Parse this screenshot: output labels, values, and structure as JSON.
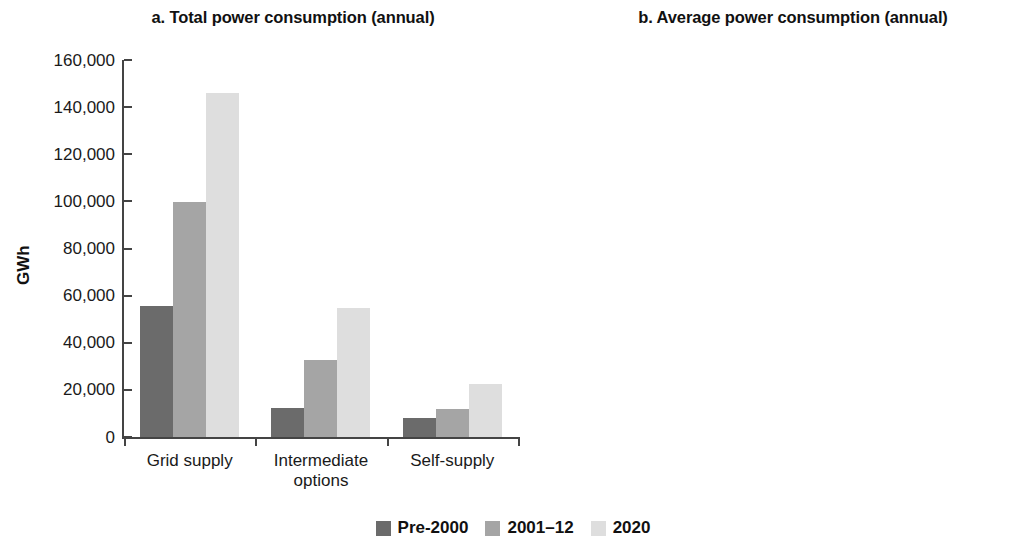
{
  "figure": {
    "legend": {
      "position": "bottom-center",
      "entries": [
        {
          "label": "Pre-2000",
          "color": "#6b6b6b"
        },
        {
          "label": "2001–12",
          "color": "#a5a5a5"
        },
        {
          "label": "2020",
          "color": "#dedede"
        }
      ]
    }
  },
  "chart_data": [
    {
      "type": "bar",
      "id": "panel-a",
      "title": "a. Total power consumption (annual)",
      "xlabel": "",
      "ylabel": "GWh",
      "ylim": [
        0,
        160000
      ],
      "yticks": [
        0,
        20000,
        40000,
        60000,
        80000,
        100000,
        120000,
        140000,
        160000
      ],
      "ytick_labels": [
        "0",
        "20,000",
        "40,000",
        "60,000",
        "80,000",
        "100,000",
        "120,000",
        "140,000",
        "160,000"
      ],
      "grid": false,
      "categories": [
        "Grid supply",
        "Intermediate options",
        "Self-supply"
      ],
      "series": [
        {
          "name": "Pre-2000",
          "color": "#6b6b6b",
          "values": [
            55800,
            12300,
            8200
          ]
        },
        {
          "name": "2001–12",
          "color": "#a5a5a5",
          "values": [
            99800,
            32800,
            11700
          ]
        },
        {
          "name": "2020",
          "color": "#dedede",
          "values": [
            146200,
            54800,
            22600
          ]
        }
      ]
    },
    {
      "type": "bar",
      "id": "panel-b",
      "title": "b. Average power consumption (annual)",
      "xlabel": "",
      "ylabel": "GWh",
      "ylim": [
        0,
        1200
      ],
      "yticks": [
        0,
        200,
        400,
        600,
        800,
        1000,
        1200
      ],
      "ytick_labels": [
        "0",
        "200",
        "400",
        "600",
        "800",
        "1,000",
        "1,200"
      ],
      "grid": false,
      "categories": [
        "Grid supply",
        "Intermediate options",
        "Self-supply"
      ],
      "series": [
        {
          "name": "Pre-2000",
          "color": "#6b6b6b",
          "values": [
            732,
            288,
            1077
          ]
        },
        {
          "name": "2001–12",
          "color": "#a5a5a5",
          "values": [
            679,
            373,
            497
          ]
        },
        {
          "name": "2020",
          "color": "#dedede",
          "values": [
            772,
            414,
            324
          ]
        }
      ]
    }
  ]
}
